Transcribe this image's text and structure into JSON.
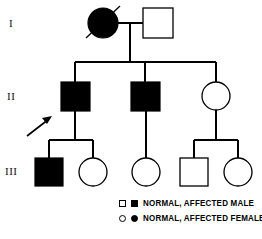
{
  "figure": {
    "type": "pedigree-chart",
    "background_color": "#ffffff",
    "line_color": "#000000",
    "affected_fill": "#000000",
    "unaffected_fill": "#ffffff"
  },
  "generations": [
    {
      "id": "I",
      "label": "I"
    },
    {
      "id": "II",
      "label": "II"
    },
    {
      "id": "III",
      "label": "III"
    }
  ],
  "individuals": [
    {
      "id": "I-1",
      "generation": "I",
      "sex": "female",
      "affected": true,
      "deceased": true,
      "shape": "circle",
      "cx": 103,
      "cy": 23,
      "r": 15
    },
    {
      "id": "I-2",
      "generation": "I",
      "sex": "male",
      "affected": false,
      "deceased": false,
      "shape": "square",
      "x": 143,
      "y": 8,
      "size": 30
    },
    {
      "id": "II-1",
      "generation": "II",
      "sex": "male",
      "affected": true,
      "proband": true,
      "deceased": false,
      "shape": "square",
      "x": 61,
      "y": 82,
      "size": 29
    },
    {
      "id": "II-2",
      "generation": "II",
      "sex": "male",
      "affected": true,
      "deceased": false,
      "shape": "square",
      "x": 131,
      "y": 82,
      "size": 29
    },
    {
      "id": "II-3",
      "generation": "II",
      "sex": "female",
      "affected": false,
      "deceased": false,
      "shape": "circle",
      "cx": 216,
      "cy": 96,
      "r": 14
    },
    {
      "id": "III-1",
      "generation": "III",
      "sex": "male",
      "affected": true,
      "deceased": false,
      "shape": "square",
      "x": 35,
      "y": 158,
      "size": 28
    },
    {
      "id": "III-2",
      "generation": "III",
      "sex": "female",
      "affected": false,
      "deceased": false,
      "shape": "circle",
      "cx": 93,
      "cy": 172,
      "r": 14
    },
    {
      "id": "III-3",
      "generation": "III",
      "sex": "female",
      "affected": false,
      "deceased": false,
      "shape": "circle",
      "cx": 146,
      "cy": 172,
      "r": 14
    },
    {
      "id": "III-4",
      "generation": "III",
      "sex": "male",
      "affected": false,
      "deceased": false,
      "shape": "square",
      "x": 180,
      "y": 158,
      "size": 28
    },
    {
      "id": "III-5",
      "generation": "III",
      "sex": "female",
      "affected": false,
      "deceased": false,
      "shape": "circle",
      "cx": 238,
      "cy": 172,
      "r": 14
    }
  ],
  "proband": {
    "points_to": "II-1",
    "arrow_tail_x": 27,
    "arrow_tail_y": 136,
    "arrow_head_x": 52,
    "arrow_head_y": 117
  },
  "legend": {
    "male_row": {
      "open_symbol": "square-open",
      "filled_symbol": "square-filled",
      "text": "NORMAL, AFFECTED  MALE"
    },
    "female_row": {
      "open_symbol": "circle-open",
      "filled_symbol": "circle-filled",
      "text": "NORMAL, AFFECTED FEMALE"
    }
  }
}
